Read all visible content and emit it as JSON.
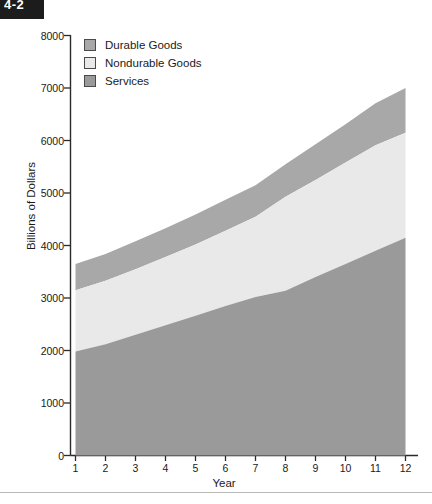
{
  "corner_label": "4-2",
  "legend": {
    "items": [
      {
        "label": "Durable Goods",
        "color": "#a8a8a8"
      },
      {
        "label": "Nondurable Goods",
        "color": "#e9e9e9"
      },
      {
        "label": "Services",
        "color": "#9a9a9a"
      }
    ]
  },
  "axes": {
    "y_title": "Billions of Dollars",
    "x_title": "Year",
    "y_ticks": [
      "0",
      "1000",
      "2000",
      "3000",
      "4000",
      "5000",
      "6000",
      "7000",
      "8000"
    ],
    "x_ticks": [
      "1",
      "2",
      "3",
      "4",
      "5",
      "6",
      "7",
      "8",
      "9",
      "10",
      "11",
      "12"
    ]
  },
  "chart_data": {
    "type": "area",
    "stacked": true,
    "title": "",
    "subtitle": "",
    "xlabel": "Year",
    "ylabel": "Billions of Dollars",
    "xlim": [
      1,
      12
    ],
    "ylim": [
      0,
      8000
    ],
    "ytick_step": 1000,
    "grid": false,
    "legend_position": "top-left",
    "x": [
      1,
      2,
      3,
      4,
      5,
      6,
      7,
      8,
      9,
      10,
      11,
      12
    ],
    "categories": [
      "1",
      "2",
      "3",
      "4",
      "5",
      "6",
      "7",
      "8",
      "9",
      "10",
      "11",
      "12"
    ],
    "series": [
      {
        "name": "Services",
        "color": "#9a9a9a",
        "values": [
          1980,
          2120,
          2300,
          2480,
          2660,
          2850,
          3020,
          3140,
          3400,
          3650,
          3900,
          4150
        ]
      },
      {
        "name": "Nondurable Goods",
        "color": "#e9e9e9",
        "values": [
          1170,
          1210,
          1250,
          1300,
          1360,
          1430,
          1530,
          1790,
          1850,
          1930,
          2010,
          2000
        ]
      },
      {
        "name": "Durable Goods",
        "color": "#a8a8a8",
        "values": [
          500,
          510,
          530,
          550,
          570,
          590,
          600,
          620,
          680,
          730,
          800,
          850
        ]
      }
    ],
    "cumulative_tops": {
      "services": [
        1980,
        2120,
        2300,
        2480,
        2660,
        2850,
        3020,
        3140,
        3400,
        3650,
        3900,
        4150
      ],
      "nondurable": [
        3150,
        3330,
        3550,
        3780,
        4020,
        4280,
        4550,
        4930,
        5250,
        5580,
        5910,
        6150
      ],
      "durable": [
        3650,
        3840,
        4080,
        4330,
        4590,
        4870,
        5150,
        5550,
        5930,
        6310,
        6710,
        7000
      ]
    }
  }
}
